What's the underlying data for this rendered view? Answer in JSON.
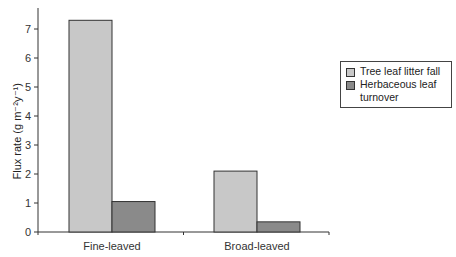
{
  "chart_data": {
    "type": "bar",
    "title": "",
    "xlabel": "",
    "ylabel": "Flux rate (g m⁻²y⁻¹)",
    "ylim": [
      0,
      7.5
    ],
    "yticks": [
      0,
      1,
      2,
      3,
      4,
      5,
      6,
      7
    ],
    "categories": [
      "Fine-leaved",
      "Broad-leaved"
    ],
    "series": [
      {
        "name": "Tree leaf litter fall",
        "values": [
          7.3,
          2.1
        ],
        "color": "#c8c8c8"
      },
      {
        "name": "Herbaceous leaf turnover",
        "values": [
          1.05,
          0.35
        ],
        "color": "#8a8a8a"
      }
    ],
    "grid": false,
    "legend_position": "right"
  },
  "legend": {
    "items": [
      {
        "label": "Tree leaf litter fall"
      },
      {
        "label_line1": "Herbaceous leaf",
        "label_line2": "turnover"
      }
    ]
  }
}
